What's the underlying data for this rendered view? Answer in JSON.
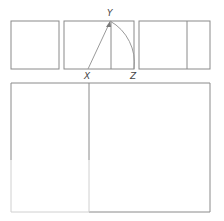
{
  "diagram": {
    "labels": {
      "x": "X",
      "y": "Y",
      "z": "Z"
    },
    "colors": {
      "stroke": "#8a8a8a",
      "faded_stroke": "#d0d0d0",
      "background": "#ffffff"
    },
    "steps": [
      {
        "name": "square"
      },
      {
        "name": "square-with-midpoint-arc"
      },
      {
        "name": "extended-golden-rectangle"
      },
      {
        "name": "large-golden-rectangle"
      }
    ]
  }
}
